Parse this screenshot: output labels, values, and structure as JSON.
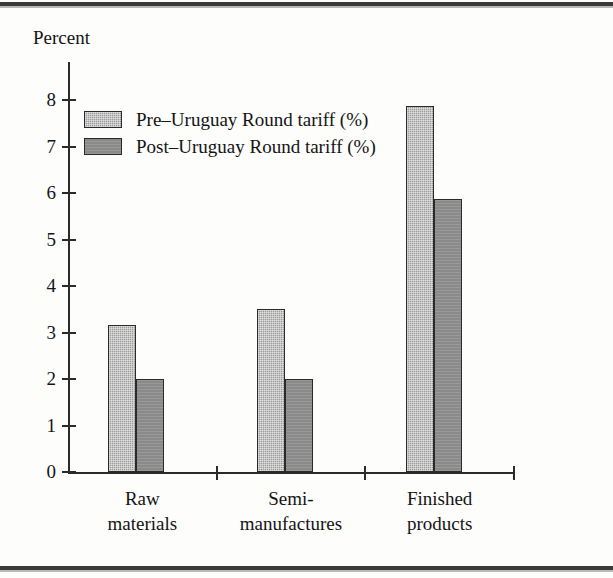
{
  "figure": {
    "axis_title": "Percent"
  },
  "chart_data": {
    "type": "bar",
    "title": "",
    "subtitle": "",
    "xlabel": "",
    "ylabel": "Percent",
    "ylim": [
      0,
      8
    ],
    "y_ticks": [
      "0",
      "1",
      "2",
      "3",
      "4",
      "5",
      "6",
      "7",
      "8"
    ],
    "grid": false,
    "legend_position": "upper-left-inside",
    "categories": [
      "Raw materials",
      "Semi-manufactures",
      "Finished products"
    ],
    "category_lines": [
      [
        "Raw",
        "materials"
      ],
      [
        "Semi-",
        "manufactures"
      ],
      [
        "Finished",
        "products"
      ]
    ],
    "series": [
      {
        "name": "Pre–Uruguay Round tariff (%)",
        "color": "#9d9d9d",
        "values": [
          3.16,
          3.51,
          7.88
        ]
      },
      {
        "name": "Post–Uruguay Round tariff (%)",
        "color": "#8a8a8a",
        "values": [
          2.01,
          2.01,
          5.87
        ]
      }
    ]
  },
  "legend": {
    "items": [
      {
        "label": "Pre–Uruguay Round tariff (%)"
      },
      {
        "label": "Post–Uruguay Round tariff (%)"
      }
    ]
  }
}
